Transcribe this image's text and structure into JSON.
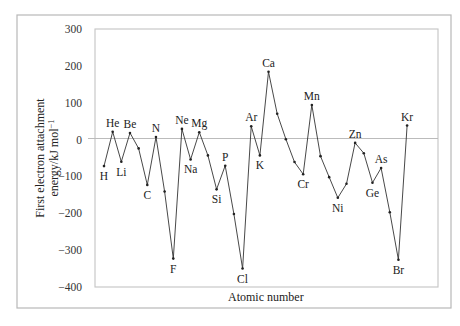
{
  "chart_data": {
    "type": "line",
    "title": "",
    "xlabel": "Atomic number",
    "ylabel": "First electron attachment energy/kJ mol⁻¹",
    "ylabel_line1": "First electron attachment",
    "ylabel_line2": "energy/kJ mol",
    "ylabel_sup": "−1",
    "ylim": [
      -400,
      300
    ],
    "yticks": [
      300,
      200,
      100,
      0,
      -100,
      -200,
      -300,
      -400
    ],
    "ytick_labels": [
      "300",
      "200",
      "100",
      "0",
      "−100",
      "−200",
      "−300",
      "−400"
    ],
    "grid": false,
    "zero_line": true,
    "legend": null,
    "x": [
      1,
      2,
      3,
      4,
      5,
      6,
      7,
      8,
      9,
      10,
      11,
      12,
      13,
      14,
      15,
      16,
      17,
      18,
      19,
      20,
      21,
      22,
      23,
      24,
      25,
      26,
      27,
      28,
      29,
      30,
      31,
      32,
      33,
      34,
      35,
      36
    ],
    "elements": [
      "H",
      "He",
      "Li",
      "Be",
      "B",
      "C",
      "N",
      "O",
      "F",
      "Ne",
      "Na",
      "Mg",
      "Al",
      "Si",
      "P",
      "S",
      "Cl",
      "Ar",
      "K",
      "Ca",
      "Sc",
      "Ti",
      "V",
      "Cr",
      "Mn",
      "Fe",
      "Co",
      "Ni",
      "Cu",
      "Zn",
      "Ga",
      "Ge",
      "As",
      "Se",
      "Br",
      "Kr"
    ],
    "values": [
      -72,
      21,
      -60,
      18,
      -24,
      -123,
      7,
      -141,
      -323,
      29,
      -54,
      20,
      -43,
      -135,
      -71,
      -202,
      -350,
      36,
      -43,
      184,
      70,
      1,
      -61,
      -94,
      94,
      -45,
      -102,
      -158,
      -120,
      -9,
      -37,
      -117,
      -77,
      -197,
      -326,
      38
    ],
    "labeled_points": [
      {
        "el": "H",
        "pos": "below"
      },
      {
        "el": "He",
        "pos": "above"
      },
      {
        "el": "Li",
        "pos": "below"
      },
      {
        "el": "Be",
        "pos": "above"
      },
      {
        "el": "C",
        "pos": "below"
      },
      {
        "el": "N",
        "pos": "above"
      },
      {
        "el": "F",
        "pos": "below"
      },
      {
        "el": "Ne",
        "pos": "above"
      },
      {
        "el": "Na",
        "pos": "below"
      },
      {
        "el": "Mg",
        "pos": "above"
      },
      {
        "el": "Si",
        "pos": "below"
      },
      {
        "el": "P",
        "pos": "above"
      },
      {
        "el": "Cl",
        "pos": "below"
      },
      {
        "el": "Ar",
        "pos": "above"
      },
      {
        "el": "K",
        "pos": "below"
      },
      {
        "el": "Ca",
        "pos": "above"
      },
      {
        "el": "Cr",
        "pos": "below"
      },
      {
        "el": "Mn",
        "pos": "above"
      },
      {
        "el": "Ni",
        "pos": "below"
      },
      {
        "el": "Zn",
        "pos": "above"
      },
      {
        "el": "Ge",
        "pos": "below"
      },
      {
        "el": "As",
        "pos": "above"
      },
      {
        "el": "Br",
        "pos": "below"
      },
      {
        "el": "Kr",
        "pos": "above"
      }
    ]
  }
}
